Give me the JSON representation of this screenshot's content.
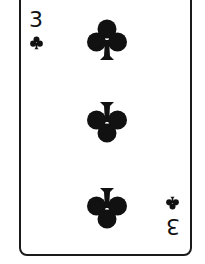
{
  "card": {
    "rank": "3",
    "suit": "clubs",
    "suit_icon": "club-icon",
    "pip_count": 3,
    "colors": {
      "ink": "#111111",
      "border": "#1a1a1a",
      "face": "#ffffff"
    }
  }
}
